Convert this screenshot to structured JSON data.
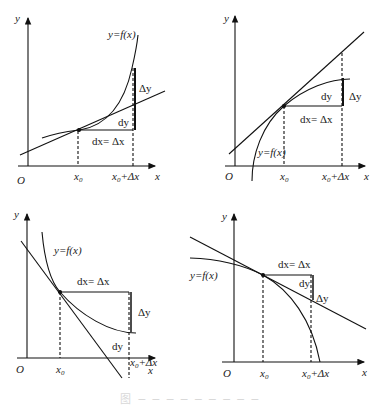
{
  "panels": [
    {
      "id": "top-left",
      "labels": {
        "y_axis": "y",
        "x_axis": "x",
        "origin": "O",
        "curve": "y=f(x)",
        "x0": "x",
        "x0_sub": "0",
        "x0dx": "x",
        "x0dx_sub": "0",
        "x0dx_rest": "+Δx",
        "dx": "dx= Δx",
        "dy": "dy",
        "Dy": "Δy"
      }
    },
    {
      "id": "top-right",
      "labels": {
        "y_axis": "y",
        "x_axis": "x",
        "origin": "O",
        "curve": "y=f(x)",
        "x0": "x",
        "x0_sub": "0",
        "x0dx": "x",
        "x0dx_sub": "0",
        "x0dx_rest": "+Δx",
        "dx": "dx= Δx",
        "dy": "dy",
        "Dy": "Δy"
      }
    },
    {
      "id": "bottom-left",
      "labels": {
        "y_axis": "y",
        "x_axis": "x",
        "origin": "O",
        "curve": "y=f(x)",
        "x0": "x",
        "x0_sub": "0",
        "x0dx": "x",
        "x0dx_sub": "0",
        "x0dx_rest": "+Δx",
        "dx": "dx= Δx",
        "dy": "dy",
        "Dy": "Δy"
      }
    },
    {
      "id": "bottom-right",
      "labels": {
        "y_axis": "y",
        "x_axis": "x",
        "origin": "O",
        "curve": "y=f(x)",
        "x0": "x",
        "x0_sub": "0",
        "x0dx": "x",
        "x0dx_sub": "0",
        "x0dx_rest": "+Δx",
        "dx": "dx= Δx",
        "dy": "dy",
        "Dy": "Δy"
      }
    }
  ],
  "caption": "图 ─ ─ ─ ─ ─ ─ ─ ─ ─"
}
